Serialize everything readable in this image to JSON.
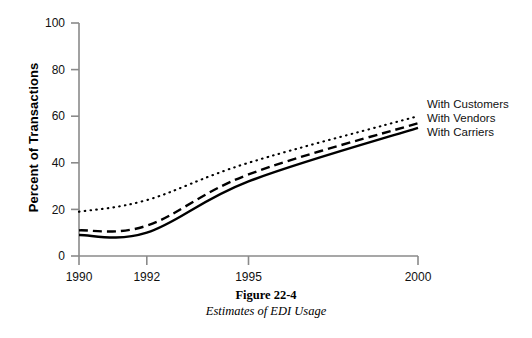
{
  "chart_data": {
    "type": "line",
    "title": "",
    "xlabel": "",
    "ylabel": "Percent of Transactions",
    "x": [
      1990,
      1992,
      1995,
      2000
    ],
    "xtick_labels": [
      "1990",
      "1992",
      "1995",
      "2000"
    ],
    "ytick_labels": [
      "0",
      "20",
      "40",
      "60",
      "80",
      "100"
    ],
    "yticks": [
      0,
      20,
      40,
      60,
      80,
      100
    ],
    "ylim": [
      0,
      100
    ],
    "xlim": [
      1990,
      2000
    ],
    "grid": false,
    "legend_position": "right-inline-end-of-lines",
    "series": [
      {
        "name": "With Customers",
        "values": [
          19,
          24,
          40,
          60
        ],
        "style": "dotted",
        "color": "#000000"
      },
      {
        "name": "With Vendors",
        "values": [
          11,
          13,
          35,
          57
        ],
        "style": "dashed",
        "color": "#000000"
      },
      {
        "name": "With Carriers",
        "values": [
          9,
          10,
          32,
          55
        ],
        "style": "solid",
        "color": "#000000"
      }
    ]
  },
  "axis": {
    "y_title": "Percent of Transactions",
    "y_tick_100": "100",
    "y_tick_80": "80",
    "y_tick_60": "60",
    "y_tick_40": "40",
    "y_tick_20": "20",
    "y_tick_0": "0",
    "x_tick_1990": "1990",
    "x_tick_1992": "1992",
    "x_tick_1995": "1995",
    "x_tick_2000": "2000"
  },
  "legend": {
    "entries": [
      {
        "label": "With Customers"
      },
      {
        "label": "With Vendors"
      },
      {
        "label": "With Carriers"
      }
    ]
  },
  "caption": {
    "title": "Figure 22-4",
    "subtitle": "Estimates of EDI Usage"
  },
  "colors": {
    "axis": "#8a8a8a",
    "line": "#000000",
    "text": "#111111",
    "background": "#ffffff"
  }
}
